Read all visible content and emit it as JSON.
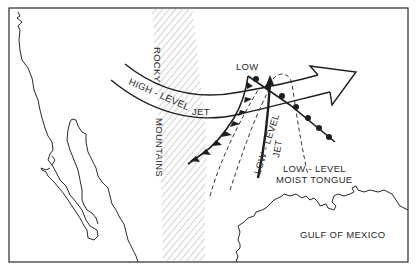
{
  "figure": {
    "type": "weather-map-schematic",
    "region": "Western and central North America",
    "colors": {
      "line": "#1e1e1e",
      "background": "#ffffff",
      "hatch": "#9a9a9a"
    }
  },
  "labels": {
    "rocky": "ROCKY",
    "mountains": "MOUNTAINS",
    "high_level_jet": "HIGH - LEVEL",
    "high_level_jet_suffix": "JET",
    "low": "LOW",
    "low_level_jet": "LOW - LEVEL",
    "low_level_jet_suffix": "JET",
    "moist_tongue_line1": "LOW - LEVEL",
    "moist_tongue_line2": "MOIST TONGUE",
    "gulf": "GULF OF MEXICO"
  },
  "features": [
    {
      "name": "Rocky Mountains",
      "symbol": "diagonal-hatched band"
    },
    {
      "name": "High-level jet",
      "symbol": "double-line arrow, west to east"
    },
    {
      "name": "Low",
      "symbol": "text label at front junction"
    },
    {
      "name": "Cold front",
      "symbol": "line with triangles"
    },
    {
      "name": "Warm front",
      "symbol": "line with semicircles"
    },
    {
      "name": "Low-level jet",
      "symbol": "thick solid arrow, south to north"
    },
    {
      "name": "Low-level moist tongue",
      "symbol": "dashed tongue outline"
    }
  ]
}
